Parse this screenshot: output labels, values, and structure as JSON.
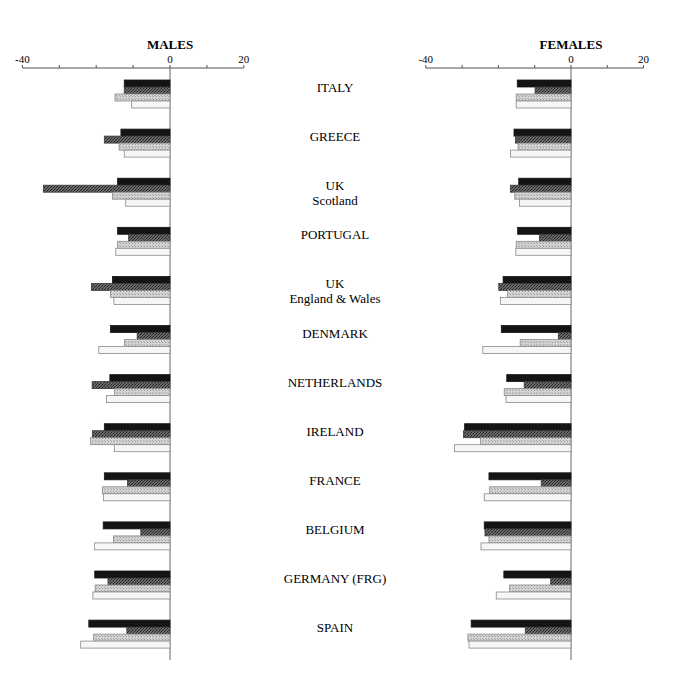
{
  "chart_data": {
    "type": "bar",
    "orientation": "horizontal",
    "panels": [
      {
        "title": "MALES",
        "xlim": [
          -40,
          20
        ],
        "xticks": [
          -40,
          -30,
          -20,
          -10,
          0,
          10,
          20
        ],
        "xtick_labels": [
          "-40",
          "",
          "",
          "",
          "0",
          "",
          "20"
        ]
      },
      {
        "title": "FEMALES",
        "xlim": [
          -40,
          20
        ],
        "xticks": [
          -40,
          -30,
          -20,
          -10,
          0,
          10,
          20
        ],
        "xtick_labels": [
          "-40",
          "",
          "",
          "",
          "0",
          "",
          "20"
        ]
      }
    ],
    "categories": [
      "ITALY",
      "GREECE",
      "UK\nScotland",
      "PORTUGAL",
      "UK\nEngland & Wales",
      "DENMARK",
      "NETHERLANDS",
      "IRELAND",
      "FRANCE",
      "BELGIUM",
      "GERMANY (FRG)",
      "SPAIN"
    ],
    "series_styles": [
      {
        "name": "Series 1",
        "pattern": "solid-black",
        "color": "#141414"
      },
      {
        "name": "Series 2",
        "pattern": "dark-crosshatch",
        "color": "#4a4a4a"
      },
      {
        "name": "Series 3",
        "pattern": "light-stipple",
        "color": "#bdbdbd"
      },
      {
        "name": "Series 4",
        "pattern": "white-outline",
        "color": "#f4f4f4"
      }
    ],
    "males": {
      "series": [
        {
          "name": "Series 1",
          "values": [
            -12.4,
            -13.3,
            -14.2,
            -14.2,
            -15.6,
            -16.1,
            -16.3,
            -17.8,
            -17.8,
            -18.1,
            -20.4,
            -22.0
          ]
        },
        {
          "name": "Series 2",
          "values": [
            -12.4,
            -17.8,
            -34.3,
            -11.2,
            -21.3,
            -8.9,
            -21.1,
            -21.0,
            -11.5,
            -7.9,
            -16.8,
            -11.7
          ]
        },
        {
          "name": "Series 3",
          "values": [
            -14.9,
            -13.8,
            -15.6,
            -14.2,
            -16.1,
            -12.3,
            -15.0,
            -21.5,
            -18.3,
            -15.3,
            -20.3,
            -20.7
          ]
        },
        {
          "name": "Series 4",
          "values": [
            -10.4,
            -12.4,
            -12.0,
            -14.7,
            -15.2,
            -19.3,
            -17.2,
            -15.1,
            -18.0,
            -20.5,
            -20.9,
            -24.2
          ]
        }
      ]
    },
    "females": {
      "series": [
        {
          "name": "Series 1",
          "values": [
            -14.8,
            -15.7,
            -14.4,
            -14.7,
            -18.7,
            -19.2,
            -17.7,
            -29.3,
            -22.6,
            -23.9,
            -18.5,
            -27.5
          ]
        },
        {
          "name": "Series 2",
          "values": [
            -9.9,
            -15.3,
            -16.7,
            -8.7,
            -19.9,
            -3.5,
            -12.9,
            -29.6,
            -8.2,
            -23.7,
            -5.6,
            -12.6
          ]
        },
        {
          "name": "Series 3",
          "values": [
            -15.1,
            -14.6,
            -15.5,
            -15.1,
            -17.5,
            -14.0,
            -18.4,
            -24.9,
            -22.4,
            -22.6,
            -16.9,
            -28.4
          ]
        },
        {
          "name": "Series 4",
          "values": [
            -15.1,
            -16.7,
            -14.2,
            -15.2,
            -19.4,
            -24.3,
            -17.9,
            -32.1,
            -23.9,
            -24.8,
            -20.6,
            -28.1
          ]
        }
      ]
    },
    "grid": false,
    "legend": null
  }
}
